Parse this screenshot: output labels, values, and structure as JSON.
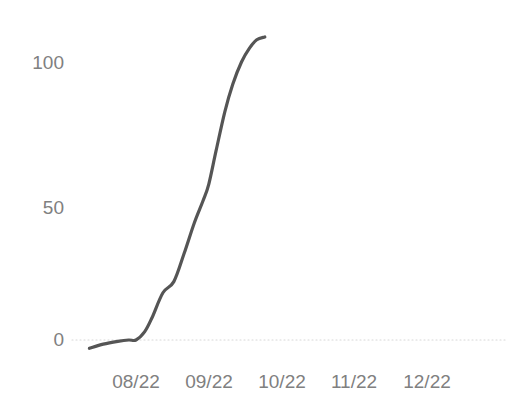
{
  "chart_data": {
    "type": "line",
    "title": "",
    "subtitle": "",
    "xlabel": "",
    "ylabel": "",
    "grid": "zero-baseline-dotted",
    "legend": "none",
    "legend_position": "none",
    "line_color": "#555555",
    "tick_color": "#808080",
    "background_color": "#ffffff",
    "categories": [
      "08/22",
      "09/22",
      "10/22",
      "11/22",
      "12/22"
    ],
    "ytick_labels": [
      "0",
      "50",
      "100"
    ],
    "ytick_values": [
      0,
      50,
      100
    ],
    "ylim": [
      -10,
      118
    ],
    "xlim": [
      -0.64,
      1.77
    ],
    "series": [
      {
        "name": "cumulative",
        "x": [
          -0.64,
          -0.45,
          -0.25,
          -0.1,
          0.0,
          0.12,
          0.22,
          0.37,
          0.52,
          0.66,
          0.8,
          0.92,
          1.0,
          1.1,
          1.22,
          1.33,
          1.45,
          1.56,
          1.66,
          1.77
        ],
        "values": [
          -3,
          -1.5,
          -0.5,
          0,
          0,
          3,
          8,
          17,
          21,
          31,
          42,
          50,
          56,
          68,
          82,
          92,
          100,
          105,
          108,
          109
        ]
      }
    ],
    "annotations": []
  },
  "axes": {
    "y_axis_name": "value-axis",
    "x_axis_name": "month-axis"
  }
}
